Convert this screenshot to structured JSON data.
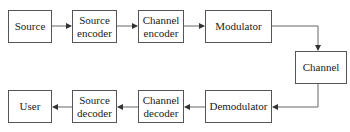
{
  "diagram": {
    "type": "block-diagram",
    "title": "",
    "nodes": [
      {
        "id": "source",
        "label": "Source"
      },
      {
        "id": "source_encoder",
        "label": "Source\nencoder"
      },
      {
        "id": "channel_encoder",
        "label": "Channel\nencoder"
      },
      {
        "id": "modulator",
        "label": "Modulator"
      },
      {
        "id": "channel",
        "label": "Channel"
      },
      {
        "id": "demodulator",
        "label": "Demodulator"
      },
      {
        "id": "channel_decoder",
        "label": "Channel\ndecoder"
      },
      {
        "id": "source_decoder",
        "label": "Source\ndecoder"
      },
      {
        "id": "user",
        "label": "User"
      }
    ],
    "edges": [
      [
        "source",
        "source_encoder"
      ],
      [
        "source_encoder",
        "channel_encoder"
      ],
      [
        "channel_encoder",
        "modulator"
      ],
      [
        "modulator",
        "channel"
      ],
      [
        "channel",
        "demodulator"
      ],
      [
        "demodulator",
        "channel_decoder"
      ],
      [
        "channel_decoder",
        "source_decoder"
      ],
      [
        "source_decoder",
        "user"
      ]
    ]
  },
  "labels": {
    "source": "Source",
    "source_encoder_1": "Source",
    "source_encoder_2": "encoder",
    "channel_encoder_1": "Channel",
    "channel_encoder_2": "encoder",
    "modulator": "Modulator",
    "channel": "Channel",
    "demodulator": "Demodulator",
    "channel_decoder_1": "Channel",
    "channel_decoder_2": "decoder",
    "source_decoder_1": "Source",
    "source_decoder_2": "decoder",
    "user": "User"
  },
  "colors": {
    "stroke": "#555555",
    "text": "#222222",
    "background": "#ffffff"
  }
}
